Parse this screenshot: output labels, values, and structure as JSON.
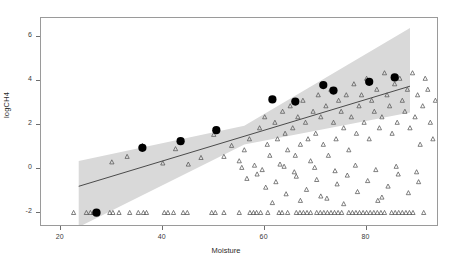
{
  "chart_data": {
    "type": "scatter",
    "title": "",
    "xlabel": "Moisture",
    "ylabel": "logCH4",
    "xlim": [
      16.1,
      94.2
    ],
    "ylim": [
      -2.65,
      6.85
    ],
    "grid": false,
    "legend": null,
    "xticks": [
      20,
      40,
      60,
      80
    ],
    "yticks": [
      -2,
      0,
      2,
      4,
      6
    ],
    "xtick_labels": [
      "20",
      "40",
      "60",
      "80"
    ],
    "ytick_labels": [
      "-2",
      "0",
      "2",
      "4",
      "6"
    ],
    "series": [
      {
        "name": "observations",
        "marker": "open-triangle",
        "color": "#555555",
        "points": [
          [
            22.5,
            -2
          ],
          [
            25.0,
            -2
          ],
          [
            25.8,
            -2
          ],
          [
            26.4,
            -2
          ],
          [
            27.0,
            -2
          ],
          [
            29.6,
            -2
          ],
          [
            31.4,
            -2
          ],
          [
            33.5,
            -2
          ],
          [
            36.2,
            -2
          ],
          [
            36.8,
            -2
          ],
          [
            40.3,
            -2
          ],
          [
            41.0,
            -2
          ],
          [
            44.0,
            -2
          ],
          [
            44.8,
            -2
          ],
          [
            49.6,
            -2
          ],
          [
            50.3,
            -2
          ],
          [
            55.0,
            -2
          ],
          [
            57.1,
            -2
          ],
          [
            57.8,
            -2
          ],
          [
            58.4,
            -2
          ],
          [
            60.6,
            -2
          ],
          [
            62.8,
            -2
          ],
          [
            63.4,
            -2
          ],
          [
            66.2,
            -2
          ],
          [
            66.9,
            -2
          ],
          [
            67.6,
            -2
          ],
          [
            69.0,
            -2
          ],
          [
            70.2,
            -2
          ],
          [
            70.9,
            -2
          ],
          [
            71.6,
            -2
          ],
          [
            72.3,
            -2
          ],
          [
            73.0,
            -2
          ],
          [
            73.7,
            -2
          ],
          [
            74.4,
            -2
          ],
          [
            75.1,
            -2
          ],
          [
            77.2,
            -2
          ],
          [
            77.9,
            -2
          ],
          [
            78.6,
            -2
          ],
          [
            79.3,
            -2
          ],
          [
            80.0,
            -2
          ],
          [
            80.7,
            -2
          ],
          [
            81.4,
            -2
          ],
          [
            82.1,
            -2
          ],
          [
            82.8,
            -2
          ],
          [
            83.5,
            -2
          ],
          [
            84.9,
            -2
          ],
          [
            85.6,
            -2
          ],
          [
            87.0,
            -2
          ],
          [
            87.7,
            -2
          ],
          [
            89.1,
            -2
          ],
          [
            91.2,
            -2
          ],
          [
            26.6,
            -2
          ],
          [
            30.2,
            -2
          ],
          [
            35.2,
            -2
          ],
          [
            42.1,
            -2
          ],
          [
            52.0,
            -2
          ],
          [
            59.2,
            -2
          ],
          [
            64.5,
            -2
          ],
          [
            68.3,
            -2
          ],
          [
            76.5,
            -2
          ],
          [
            86.3,
            -2
          ],
          [
            88.4,
            -2
          ],
          [
            30.0,
            0.3
          ],
          [
            33.0,
            0.55
          ],
          [
            36.0,
            1.05
          ],
          [
            40.0,
            0.25
          ],
          [
            42.5,
            0.9
          ],
          [
            45.0,
            0.2
          ],
          [
            47.5,
            0.5
          ],
          [
            50.0,
            1.55
          ],
          [
            52.0,
            0.55
          ],
          [
            53.5,
            1.05
          ],
          [
            55.0,
            0.35
          ],
          [
            56.0,
            0.85
          ],
          [
            57.0,
            1.35
          ],
          [
            58.0,
            0.15
          ],
          [
            59.0,
            1.85
          ],
          [
            60.0,
            2.35
          ],
          [
            60.5,
            1.1
          ],
          [
            61.0,
            0.6
          ],
          [
            62.0,
            2.1
          ],
          [
            62.5,
            1.35
          ],
          [
            63.0,
            0.2
          ],
          [
            63.5,
            2.6
          ],
          [
            64.0,
            1.6
          ],
          [
            64.5,
            0.85
          ],
          [
            65.0,
            2.85
          ],
          [
            65.5,
            1.85
          ],
          [
            66.0,
            0.6
          ],
          [
            66.5,
            2.35
          ],
          [
            67.0,
            1.1
          ],
          [
            67.5,
            3.1
          ],
          [
            68.0,
            2.1
          ],
          [
            68.5,
            1.35
          ],
          [
            69.0,
            0.35
          ],
          [
            69.5,
            2.6
          ],
          [
            70.0,
            1.6
          ],
          [
            70.5,
            3.35
          ],
          [
            71.0,
            2.35
          ],
          [
            71.5,
            1.1
          ],
          [
            72.0,
            2.85
          ],
          [
            72.5,
            0.6
          ],
          [
            73.0,
            3.6
          ],
          [
            73.5,
            2.1
          ],
          [
            74.0,
            1.35
          ],
          [
            74.5,
            3.1
          ],
          [
            75.0,
            2.6
          ],
          [
            75.5,
            1.85
          ],
          [
            76.0,
            3.35
          ],
          [
            76.5,
            0.85
          ],
          [
            77.0,
            2.35
          ],
          [
            77.5,
            3.85
          ],
          [
            78.0,
            1.6
          ],
          [
            78.5,
            2.85
          ],
          [
            79.0,
            3.35
          ],
          [
            79.5,
            2.1
          ],
          [
            80.0,
            4.1
          ],
          [
            80.5,
            1.35
          ],
          [
            81.0,
            3.1
          ],
          [
            81.5,
            2.6
          ],
          [
            82.0,
            3.6
          ],
          [
            82.5,
            1.85
          ],
          [
            83.0,
            2.35
          ],
          [
            83.5,
            4.35
          ],
          [
            84.0,
            3.35
          ],
          [
            84.5,
            2.85
          ],
          [
            85.0,
            1.6
          ],
          [
            85.5,
            3.85
          ],
          [
            86.0,
            2.1
          ],
          [
            86.5,
            4.1
          ],
          [
            87.0,
            3.1
          ],
          [
            87.5,
            2.6
          ],
          [
            88.0,
            3.6
          ],
          [
            88.5,
            1.85
          ],
          [
            89.0,
            4.35
          ],
          [
            89.5,
            2.35
          ],
          [
            90.0,
            3.35
          ],
          [
            90.5,
            1.1
          ],
          [
            91.0,
            2.85
          ],
          [
            91.5,
            4.1
          ],
          [
            92.0,
            3.6
          ],
          [
            92.5,
            2.1
          ],
          [
            93.0,
            1.35
          ],
          [
            93.5,
            3.1
          ],
          [
            56.5,
            -0.45
          ],
          [
            58.5,
            -0.25
          ],
          [
            60.2,
            -0.85
          ],
          [
            62.2,
            -0.6
          ],
          [
            64.2,
            -1.15
          ],
          [
            66.2,
            -0.35
          ],
          [
            68.2,
            -0.95
          ],
          [
            70.2,
            -0.5
          ],
          [
            72.2,
            -1.35
          ],
          [
            74.2,
            -0.7
          ],
          [
            76.2,
            -0.3
          ],
          [
            78.2,
            -1.05
          ],
          [
            80.2,
            -0.55
          ],
          [
            82.2,
            -1.45
          ],
          [
            84.2,
            -0.8
          ],
          [
            86.2,
            -0.25
          ],
          [
            88.2,
            -1.1
          ],
          [
            90.2,
            -0.6
          ],
          [
            61.5,
            -1.55
          ],
          [
            71.0,
            -1.25
          ],
          [
            75.5,
            -1.6
          ],
          [
            83.0,
            -1.3
          ],
          [
            67.0,
            -1.45
          ],
          [
            55.5,
            0.05
          ],
          [
            59.5,
            -0.05
          ],
          [
            63.8,
            0.1
          ],
          [
            65.8,
            -0.15
          ],
          [
            69.8,
            0.05
          ],
          [
            73.8,
            -0.1
          ],
          [
            77.8,
            0.15
          ],
          [
            81.8,
            -0.05
          ],
          [
            85.8,
            0.1
          ],
          [
            89.8,
            -0.15
          ]
        ]
      },
      {
        "name": "binned-means",
        "marker": "filled-circle",
        "color": "#000000",
        "points": [
          [
            27.0,
            -2.0
          ],
          [
            36.0,
            0.95
          ],
          [
            43.5,
            1.25
          ],
          [
            50.5,
            1.75
          ],
          [
            61.5,
            3.15
          ],
          [
            66.0,
            3.05
          ],
          [
            71.5,
            3.8
          ],
          [
            73.5,
            3.55
          ],
          [
            80.5,
            3.95
          ],
          [
            85.5,
            4.15
          ]
        ]
      }
    ],
    "fit_line": {
      "name": "regression-line",
      "color": "#3a3a3a",
      "x_start": 23.5,
      "y_start": -0.8,
      "x_end": 88.5,
      "y_end": 3.75
    },
    "confidence_band": {
      "name": "confidence-interval",
      "color": "#d9d9d9",
      "x_start": 23.5,
      "x_end": 88.5,
      "lower_start": -2.65,
      "upper_start": 0.35,
      "lower_mid": 1.1,
      "upper_mid": 1.95,
      "lower_end": 2.55,
      "upper_end": 6.4
    }
  }
}
